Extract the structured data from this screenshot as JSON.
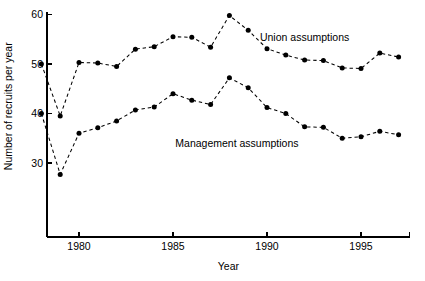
{
  "chart_data": {
    "type": "line",
    "title": "",
    "xlabel": "Year",
    "ylabel": "Number of recruits per year",
    "x": [
      1978,
      1979,
      1980,
      1981,
      1982,
      1983,
      1984,
      1985,
      1986,
      1987,
      1988,
      1989,
      1990,
      1991,
      1992,
      1993,
      1994,
      1995,
      1996,
      1997
    ],
    "xlim": [
      1977.6,
      1997.4
    ],
    "ylim": [
      22.0,
      61.0
    ],
    "xticks": [
      1980,
      1985,
      1990,
      1995
    ],
    "xtick_labels": [
      "1980",
      "1985",
      "1990",
      "1995"
    ],
    "yticks": [
      30,
      40,
      50,
      60
    ],
    "ytick_labels": [
      "30",
      "40",
      "50",
      "60"
    ],
    "grid": false,
    "legend_position": "inline-annotation",
    "marker": "filled-circle",
    "linestyle": "dashed",
    "color": "#000000",
    "series": [
      {
        "name": "Union assumptions",
        "label_x": 1992.0,
        "label_y": 54.6,
        "values": [
          50.0,
          39.5,
          50.3,
          50.2,
          49.5,
          53.0,
          53.5,
          55.5,
          55.4,
          53.4,
          59.8,
          56.8,
          53.1,
          51.8,
          50.8,
          50.7,
          49.2,
          49.1,
          52.2,
          51.4
        ]
      },
      {
        "name": "Management assumptions",
        "label_x": 1988.4,
        "label_y": 33.2,
        "values": [
          40.0,
          27.7,
          36.0,
          37.1,
          38.5,
          40.7,
          41.3,
          44.0,
          42.7,
          41.8,
          47.2,
          45.2,
          41.2,
          40.0,
          37.3,
          37.2,
          35.0,
          35.3,
          36.4,
          35.7
        ]
      }
    ]
  }
}
